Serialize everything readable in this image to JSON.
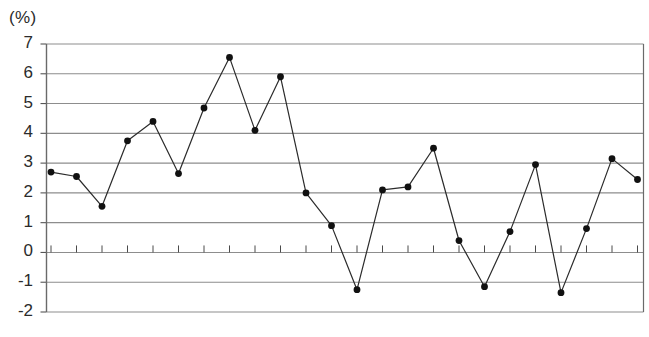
{
  "chart_data": {
    "type": "line",
    "title": "",
    "subtitle": "",
    "xlabel": "",
    "ylabel": "",
    "unit_label": "(%)",
    "ylim": [
      -2,
      7
    ],
    "ytick_labels": [
      "7",
      "6",
      "5",
      "4",
      "3",
      "2",
      "1",
      "0",
      "-1",
      "-2"
    ],
    "ytick_values": [
      7,
      6,
      5,
      4,
      3,
      2,
      1,
      0,
      -1,
      -2
    ],
    "grid": true,
    "grid_axis": "y",
    "legend": "none",
    "x_tick_count": 24,
    "x_tick_labels": [],
    "marker": "filled-circle",
    "line_color": "#2b2b2b",
    "marker_color": "#111111",
    "grid_color": "#8d8d8d",
    "axis_color": "#555555",
    "background_color": "#ffffff",
    "x": [
      1,
      2,
      3,
      4,
      5,
      6,
      7,
      8,
      9,
      10,
      11,
      12,
      13,
      14,
      15,
      16,
      17,
      18,
      19,
      20,
      21,
      22,
      23,
      24
    ],
    "values": [
      2.7,
      2.55,
      1.55,
      3.75,
      4.4,
      2.65,
      4.85,
      6.55,
      4.1,
      5.9,
      2.0,
      0.9,
      -1.25,
      2.1,
      2.2,
      3.5,
      0.4,
      -1.15,
      0.7,
      2.95,
      -1.35,
      0.8,
      3.15,
      2.45
    ]
  }
}
